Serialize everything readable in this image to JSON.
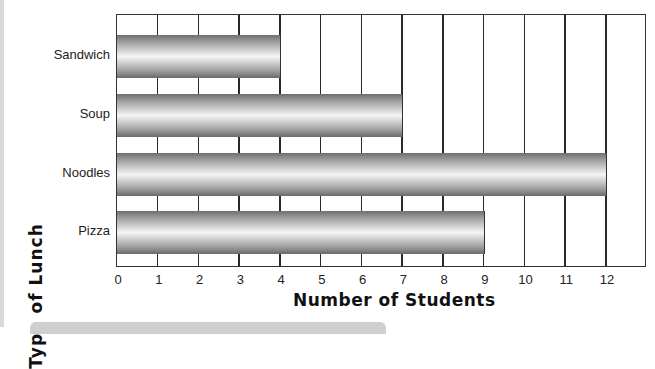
{
  "chart_data": {
    "type": "bar",
    "orientation": "horizontal",
    "title": "",
    "categories": [
      "Sandwich",
      "Soup",
      "Noodles",
      "Pizza"
    ],
    "values": [
      4,
      7,
      12,
      9
    ],
    "xlabel": "Number of Students",
    "ylabel": "Type of Lunch",
    "xlim": [
      0,
      13
    ],
    "x_ticks": [
      "0",
      "1",
      "2",
      "3",
      "4",
      "5",
      "6",
      "7",
      "8",
      "9",
      "10",
      "11",
      "12"
    ],
    "grid": true,
    "legend": null
  },
  "labels": {
    "categories": [
      "Sandwich",
      "Soup",
      "Noodles",
      "Pizza"
    ],
    "ticks": [
      "0",
      "1",
      "2",
      "3",
      "4",
      "5",
      "6",
      "7",
      "8",
      "9",
      "10",
      "11",
      "12"
    ],
    "xaxis_title": "Number of Students",
    "yaxis_title": "Type of Lunch"
  },
  "colors": {
    "bar_dark": "#6e6e6e",
    "bar_light": "#f4f4f4",
    "grid": "#2a2a2a"
  }
}
